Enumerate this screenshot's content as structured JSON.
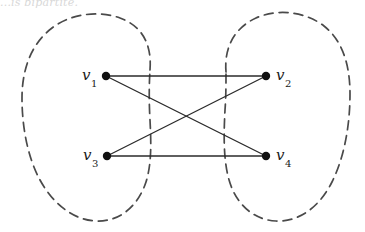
{
  "figure": {
    "kind": "bipartite-graph-diagram",
    "caption_fragment": "...is bipartite.",
    "background_color": "#ffffff",
    "width": 365,
    "height": 232
  },
  "graph": {
    "stroke_color": "#2b2b2b",
    "edge_width": 1.3,
    "vertex_radius": 4.2,
    "vertex_fill": "#111111",
    "vertices": [
      {
        "id": "v1",
        "label": "v",
        "subscript": "1",
        "x": 106,
        "y": 76,
        "label_x": 82,
        "label_y": 68,
        "part": "left"
      },
      {
        "id": "v2",
        "label": "v",
        "subscript": "2",
        "x": 266,
        "y": 76,
        "label_x": 276,
        "label_y": 68,
        "part": "right"
      },
      {
        "id": "v3",
        "label": "v",
        "subscript": "3",
        "x": 107,
        "y": 156,
        "label_x": 83,
        "label_y": 148,
        "part": "left"
      },
      {
        "id": "v4",
        "label": "v",
        "subscript": "4",
        "x": 266,
        "y": 156,
        "label_x": 276,
        "label_y": 148,
        "part": "right"
      }
    ],
    "edges": [
      {
        "id": "e-v1-v2",
        "from": "v1",
        "to": "v2",
        "x1": 106,
        "y1": 76,
        "x2": 266,
        "y2": 76
      },
      {
        "id": "e-v1-v4",
        "from": "v1",
        "to": "v4",
        "x1": 106,
        "y1": 76,
        "x2": 266,
        "y2": 156
      },
      {
        "id": "e-v3-v2",
        "from": "v3",
        "to": "v2",
        "x1": 107,
        "y1": 156,
        "x2": 266,
        "y2": 76
      },
      {
        "id": "e-v3-v4",
        "from": "v3",
        "to": "v4",
        "x1": 107,
        "y1": 156,
        "x2": 266,
        "y2": 156
      }
    ]
  },
  "partitions": {
    "stroke_color": "#4a4a4a",
    "stroke_width": 1.7,
    "dash_pattern": "9 6",
    "left": {
      "id": "left-partition-blob",
      "members": [
        "v1",
        "v3"
      ],
      "path": "M 150 70 C 152 44 142 26 120 18 C 98 10 70 14 52 28 C 32 43 22 68 22 98 C 22 128 28 158 40 180 C 52 202 72 220 96 221 C 120 222 138 206 146 182 C 152 163 151 140 150 120 C 149 103 149 86 150 70 Z"
    },
    "right": {
      "id": "right-partition-blob",
      "members": [
        "v2",
        "v4"
      ],
      "path": "M 226 72 C 224 48 234 28 256 18 C 278 8 306 12 324 26 C 342 40 350 64 350 94 C 350 126 344 158 332 182 C 320 206 300 222 276 221 C 252 220 234 202 228 176 C 223 155 224 130 225 110 C 226 97 226 84 226 72 Z"
    }
  }
}
